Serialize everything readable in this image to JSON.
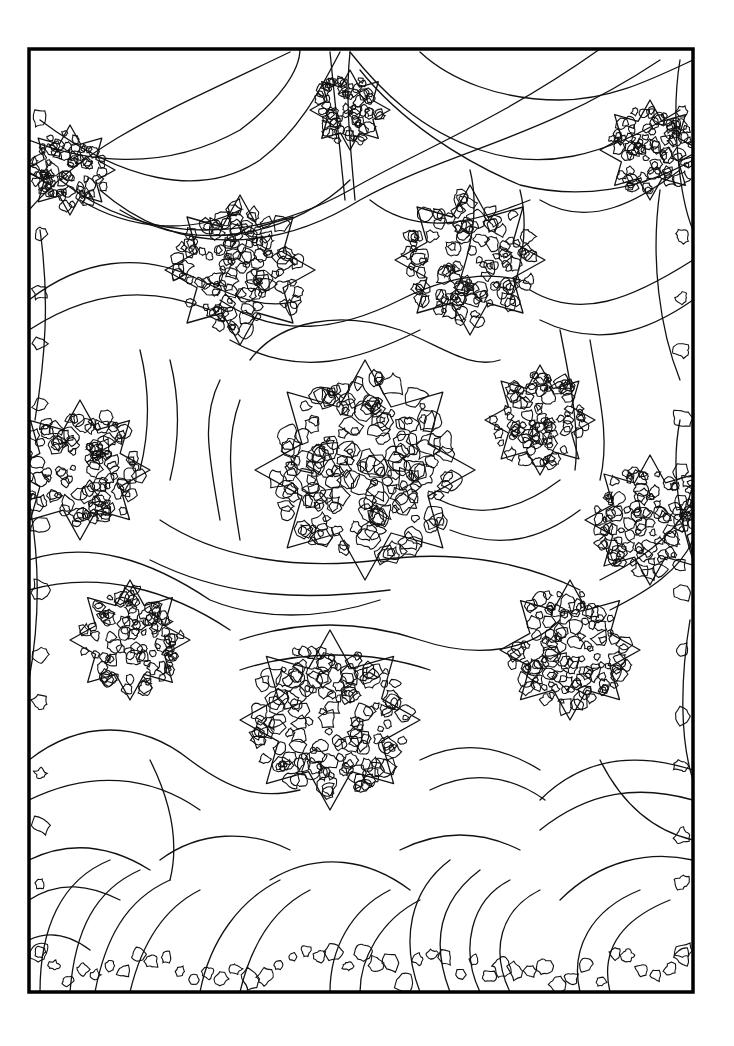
{
  "page": {
    "type": "coloring-page",
    "background_color": "#ffffff",
    "line_color": "#111111",
    "frame": {
      "x": 29,
      "y": 49,
      "width": 664,
      "height": 943,
      "stroke_width": 3.5,
      "color": "#000000"
    }
  },
  "motifs": {
    "swags_rows": 5,
    "star_clusters": [
      {
        "cx": 365,
        "cy": 470,
        "r": 110
      },
      {
        "cx": 240,
        "cy": 270,
        "r": 75
      },
      {
        "cx": 470,
        "cy": 260,
        "r": 75
      },
      {
        "cx": 80,
        "cy": 470,
        "r": 70
      },
      {
        "cx": 650,
        "cy": 520,
        "r": 65
      },
      {
        "cx": 330,
        "cy": 720,
        "r": 90
      },
      {
        "cx": 570,
        "cy": 650,
        "r": 70
      },
      {
        "cx": 130,
        "cy": 640,
        "r": 60
      },
      {
        "cx": 650,
        "cy": 150,
        "r": 50
      },
      {
        "cx": 70,
        "cy": 170,
        "r": 45
      },
      {
        "cx": 350,
        "cy": 110,
        "r": 40
      },
      {
        "cx": 540,
        "cy": 420,
        "r": 55
      }
    ]
  }
}
